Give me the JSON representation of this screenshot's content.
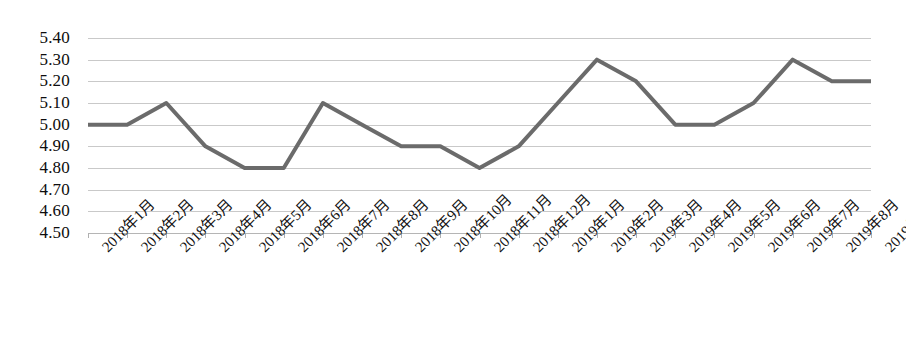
{
  "chart_data": {
    "type": "line",
    "title": "",
    "xlabel": "",
    "ylabel": "",
    "ylim": [
      4.5,
      5.4
    ],
    "ytick_step": 0.1,
    "grid": true,
    "legend": "none",
    "line_color": "#6b6b6b",
    "categories": [
      "2018年1月",
      "2018年2月",
      "2018年3月",
      "2018年4月",
      "2018年5月",
      "2018年6月",
      "2018年7月",
      "2018年8月",
      "2018年9月",
      "2018年10月",
      "2018年11月",
      "2018年12月",
      "2019年1月",
      "2019年2月",
      "2019年3月",
      "2019年4月",
      "2019年5月",
      "2019年6月",
      "2019年7月",
      "2019年8月",
      "2019年9月"
    ],
    "values": [
      5.0,
      5.0,
      5.1,
      4.9,
      4.8,
      4.8,
      5.1,
      5.0,
      4.9,
      4.9,
      4.8,
      4.9,
      5.1,
      5.3,
      5.2,
      5.0,
      5.0,
      5.1,
      5.3,
      5.2,
      5.2
    ],
    "ytick_labels": [
      "5.40",
      "5.30",
      "5.20",
      "5.10",
      "5.00",
      "4.90",
      "4.80",
      "4.70",
      "4.60",
      "4.50"
    ],
    "ytick_values": [
      5.4,
      5.3,
      5.2,
      5.1,
      5.0,
      4.9,
      4.8,
      4.7,
      4.6,
      4.5
    ]
  }
}
